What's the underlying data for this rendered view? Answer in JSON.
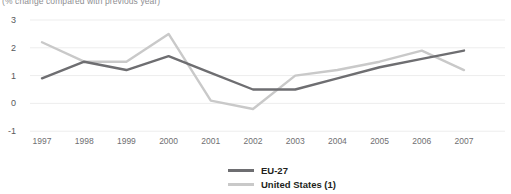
{
  "chart_data": {
    "type": "line",
    "title": "",
    "subtitle": "(% change compared with previous year)",
    "xlabel": "",
    "ylabel": "",
    "x": [
      1997,
      1998,
      1999,
      2000,
      2001,
      2002,
      2003,
      2004,
      2005,
      2006,
      2007
    ],
    "xtick_labels": [
      "1997",
      "1998",
      "1999",
      "2000",
      "2001",
      "2002",
      "2003",
      "2004",
      "2005",
      "2006",
      "2007"
    ],
    "ytick_labels": [
      "3",
      "2",
      "1",
      "0",
      "-1"
    ],
    "yticks": [
      3,
      2,
      1,
      0,
      -1
    ],
    "ylim": [
      -1,
      3
    ],
    "grid": true,
    "legend_position": "bottom",
    "series": [
      {
        "name": "EU-27",
        "color": "#6e6e71",
        "values": [
          0.9,
          1.5,
          1.2,
          1.7,
          1.1,
          0.5,
          0.5,
          0.9,
          1.3,
          1.6,
          1.9
        ]
      },
      {
        "name": "United States (1)",
        "color": "#c9c9c9",
        "values": [
          2.2,
          1.5,
          1.5,
          2.5,
          0.1,
          -0.2,
          1.0,
          1.2,
          1.5,
          1.9,
          1.2
        ]
      }
    ]
  },
  "legend": {
    "items": [
      {
        "label": "EU-27",
        "color": "#6e6e71"
      },
      {
        "label": "United States (1)",
        "color": "#c9c9c9"
      }
    ]
  },
  "axes": {
    "y_labels": [
      "3",
      "2",
      "1",
      "0",
      "-1"
    ],
    "x_labels": [
      "1997",
      "1998",
      "1999",
      "2000",
      "2001",
      "2002",
      "2003",
      "2004",
      "2005",
      "2006",
      "2007"
    ]
  }
}
